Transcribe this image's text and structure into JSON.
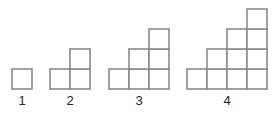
{
  "diagram": {
    "cell_size": 20,
    "stroke_color": "#8a8a8a",
    "figures": [
      {
        "label": "1",
        "steps": 1,
        "columns": [
          1
        ],
        "origin_x": 12,
        "label_x": 22
      },
      {
        "label": "2",
        "steps": 2,
        "columns": [
          1,
          2
        ],
        "origin_x": 50,
        "label_x": 70
      },
      {
        "label": "3",
        "steps": 3,
        "columns": [
          1,
          2,
          3
        ],
        "origin_x": 109,
        "label_x": 139
      },
      {
        "label": "4",
        "steps": 4,
        "columns": [
          1,
          2,
          3,
          4
        ],
        "origin_x": 187,
        "label_x": 227
      }
    ],
    "baseline_y": 89,
    "label_y": 105
  }
}
